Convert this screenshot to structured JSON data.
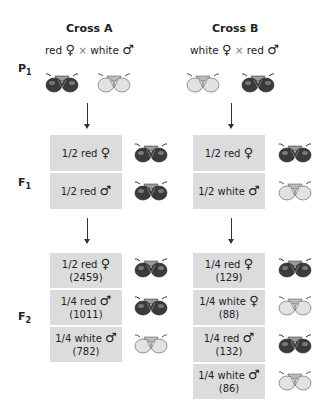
{
  "cross_a": {
    "title": "Cross A",
    "parents": {
      "female": "red",
      "female_symbol": "♀",
      "cross": "×",
      "male": "white",
      "male_symbol": "♂"
    },
    "f1": [
      {
        "fraction": "1/2 red",
        "symbol": "♀",
        "eye": "red"
      },
      {
        "fraction": "1/2 red",
        "symbol": "♂",
        "eye": "red"
      }
    ],
    "f2": [
      {
        "fraction": "1/2 red",
        "symbol": "♀",
        "count": "(2459)",
        "eye": "red"
      },
      {
        "fraction": "1/4 red",
        "symbol": "♂",
        "count": "(1011)",
        "eye": "red"
      },
      {
        "fraction": "1/4 white",
        "symbol": "♂",
        "count": "(782)",
        "eye": "white"
      }
    ]
  },
  "cross_b": {
    "title": "Cross B",
    "parents": {
      "female": "white",
      "female_symbol": "♀",
      "cross": "×",
      "male": "red",
      "male_symbol": "♂"
    },
    "f1": [
      {
        "fraction": "1/2 red",
        "symbol": "♀",
        "eye": "red"
      },
      {
        "fraction": "1/2 white",
        "symbol": "♂",
        "eye": "white"
      }
    ],
    "f2": [
      {
        "fraction": "1/4 red",
        "symbol": "♀",
        "count": "(129)",
        "eye": "red"
      },
      {
        "fraction": "1/4 white",
        "symbol": "♀",
        "count": "(88)",
        "eye": "white"
      },
      {
        "fraction": "1/4 red",
        "symbol": "♂",
        "count": "(132)",
        "eye": "red"
      },
      {
        "fraction": "1/4 white",
        "symbol": "♂",
        "count": "(86)",
        "eye": "white"
      }
    ]
  },
  "generations": {
    "p1": "P",
    "p1_sub": "1",
    "f1": "F",
    "f1_sub": "1",
    "f2": "F",
    "f2_sub": "2"
  },
  "colors": {
    "box_bg": "#dcdcdc",
    "red_eye": "#3a3a3a",
    "white_eye": "#d8d8d8"
  }
}
